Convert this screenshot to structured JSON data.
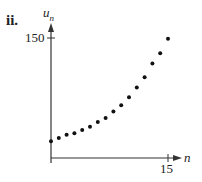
{
  "part_label": "ii.",
  "chart_data": {
    "type": "scatter",
    "title": "",
    "xlabel": "n",
    "ylabel": "u_n",
    "ylabel_main": "u",
    "ylabel_sub": "n",
    "x_ticks": [
      "15"
    ],
    "y_ticks": [
      "150"
    ],
    "xlim": [
      0,
      16
    ],
    "ylim": [
      0,
      160
    ],
    "grid": false,
    "x": [
      0,
      1,
      2,
      3,
      4,
      5,
      6,
      7,
      8,
      9,
      10,
      11,
      12,
      13,
      14,
      15
    ],
    "values": [
      21,
      25,
      29,
      31,
      35,
      39,
      45,
      50,
      58,
      66,
      76,
      88,
      101,
      118,
      131,
      149
    ]
  }
}
